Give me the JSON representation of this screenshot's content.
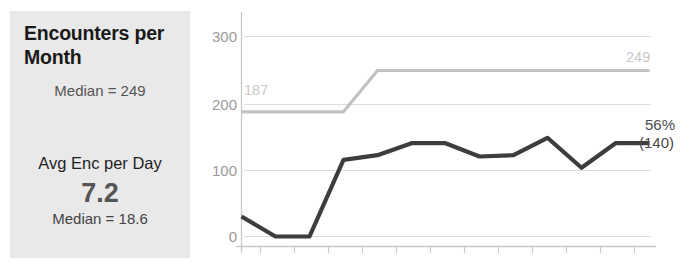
{
  "card": {
    "title": "Encounters per Month",
    "median_label": "Median = 249",
    "secondary_title": "Avg Enc per Day",
    "secondary_value": "7.2",
    "secondary_median_label": "Median = 18.6",
    "background_color": "#e9e9e9"
  },
  "chart_labels": {
    "y_300": "300",
    "y_200": "200",
    "y_100": "100",
    "y_0": "0",
    "gray_start_label": "187",
    "gray_end_label": "249",
    "dark_end_percent": "56%",
    "dark_end_value": "(140)"
  },
  "chart_data": {
    "type": "line",
    "title": "Encounters per Month",
    "xlabel": "",
    "ylabel": "",
    "ylim": [
      0,
      320
    ],
    "yticks": [
      0,
      100,
      200,
      300
    ],
    "grid": true,
    "legend": "none",
    "x": [
      1,
      2,
      3,
      4,
      5,
      6,
      7,
      8,
      9,
      10,
      11,
      12,
      13
    ],
    "series": [
      {
        "name": "Target / Benchmark",
        "color": "#c2c2c2",
        "start_annotation": "187",
        "end_annotation": "249",
        "values": [
          187,
          187,
          187,
          187,
          249,
          249,
          249,
          249,
          249,
          249,
          249,
          249,
          249
        ]
      },
      {
        "name": "Encounters",
        "color": "#3d3d3d",
        "end_annotation": "56% (140)",
        "values": [
          30,
          0,
          0,
          115,
          122,
          140,
          140,
          120,
          122,
          148,
          103,
          140,
          140
        ]
      }
    ]
  }
}
